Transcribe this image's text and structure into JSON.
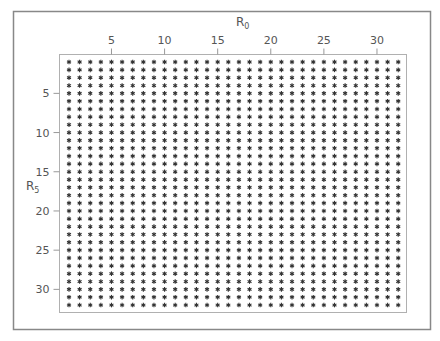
{
  "chart_data": {
    "type": "scatter",
    "title": "",
    "xlabel": "R0",
    "xlabel_main": "R",
    "xlabel_sub": "0",
    "ylabel": "R5",
    "ylabel_main": "R",
    "ylabel_sub": "5",
    "x_axis_position": "top",
    "y_axis_inverted": true,
    "xlim": [
      1,
      32
    ],
    "ylim": [
      1,
      32
    ],
    "x_ticks": [
      5,
      10,
      15,
      20,
      25,
      30
    ],
    "y_ticks": [
      5,
      10,
      15,
      20,
      25,
      30
    ],
    "grid": false,
    "legend": null,
    "marker": "*",
    "marker_color": "#333333",
    "x_values": [
      1,
      2,
      3,
      4,
      5,
      6,
      7,
      8,
      9,
      10,
      11,
      12,
      13,
      14,
      15,
      16,
      17,
      18,
      19,
      20,
      21,
      22,
      23,
      24,
      25,
      26,
      27,
      28,
      29,
      30,
      31,
      32
    ],
    "y_values": [
      1,
      2,
      3,
      4,
      5,
      6,
      7,
      8,
      9,
      10,
      11,
      12,
      13,
      14,
      15,
      16,
      17,
      18,
      19,
      20,
      21,
      22,
      23,
      24,
      25,
      26,
      27,
      28,
      29,
      30,
      31,
      32
    ],
    "point_count": 1024
  },
  "colors": {
    "frame": "#888888",
    "plot_frame": "#aaaaaa",
    "marker": "#333333",
    "text": "#555555",
    "background": "#ffffff"
  }
}
